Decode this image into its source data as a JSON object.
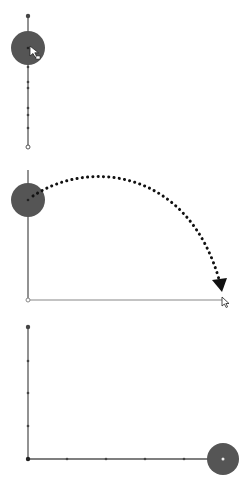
{
  "figure": {
    "colors": {
      "background": "#ffffff",
      "axis": "#6e6e6e",
      "handle": "#555555",
      "tick": "#444444",
      "arrow": "#111111"
    },
    "panels": [
      {
        "id": "panel-1",
        "label": "Handle on vertical axis with cursor",
        "axis_x": 28,
        "axis_top": 16,
        "axis_bottom": 147,
        "handle": {
          "cx": 28,
          "cy": 48,
          "r": 17
        },
        "ticks_y": [
          16,
          67,
          82,
          88,
          108,
          115,
          128
        ],
        "end_marker_y": 147,
        "cursor": {
          "x": 31,
          "y": 48,
          "icon": "move-cursor-icon"
        }
      },
      {
        "id": "panel-2",
        "label": "Drag path arcing from vertical axis to horizontal axis end",
        "axis_x": 28,
        "axis_top": 170,
        "origin_y": 300,
        "axis_right": 224,
        "handle": {
          "cx": 28,
          "cy": 200,
          "r": 17
        },
        "arc": {
          "start": [
            33,
            196
          ],
          "control1": [
            90,
            158
          ],
          "control2": [
            190,
            170
          ],
          "end": [
            220,
            283
          ]
        },
        "arrowhead_tip": [
          221,
          291
        ],
        "cursor": {
          "x": 224,
          "y": 300,
          "icon": "pointer-cursor-icon"
        }
      },
      {
        "id": "panel-3",
        "label": "Handle moved to end of horizontal axis",
        "axis_x": 28,
        "axis_top": 327,
        "origin_y": 459,
        "axis_right": 223,
        "ticks_y": [
          327,
          361,
          393,
          426
        ],
        "ticks_x": [
          67,
          106,
          145,
          184
        ],
        "handle": {
          "cx": 223,
          "cy": 459,
          "r": 16
        }
      }
    ]
  }
}
